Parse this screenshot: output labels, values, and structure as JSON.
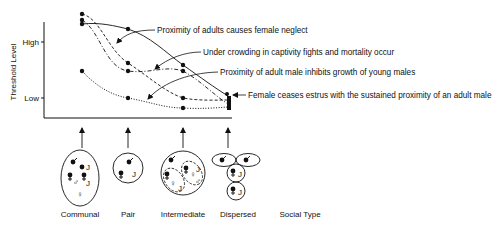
{
  "figure": {
    "y_axis": {
      "title": "Threshold Level",
      "ticks": [
        {
          "label": "High",
          "y": 42
        },
        {
          "label": "Low",
          "y": 98
        }
      ]
    },
    "x_axis": {
      "title": "Social Type",
      "categories": [
        "Communal",
        "Pair",
        "Intermediate",
        "Dispersed"
      ]
    },
    "curves": [
      {
        "name": "female-neglect",
        "label": "Proximity of adults causes female neglect",
        "style": "solid",
        "points": [
          [
            82,
            24
          ],
          [
            128,
            29
          ],
          [
            183,
            65
          ],
          [
            228,
            96
          ]
        ]
      },
      {
        "name": "crowding",
        "label": "Under crowding in captivity fights and mortality occur",
        "style": "dashed",
        "points": [
          [
            82,
            14
          ],
          [
            128,
            63
          ],
          [
            183,
            98
          ],
          [
            228,
            100
          ]
        ]
      },
      {
        "name": "young-males",
        "label": "Proximity of adult male inhibits growth of young males",
        "style": "dash-dot",
        "points": [
          [
            82,
            20
          ],
          [
            128,
            71
          ],
          [
            183,
            71
          ],
          [
            228,
            104
          ]
        ]
      },
      {
        "name": "estrus",
        "label": "Female ceases estrus with the sustained proximity of an adult male",
        "style": "dotted",
        "points": [
          [
            82,
            71
          ],
          [
            128,
            98
          ],
          [
            183,
            108
          ],
          [
            228,
            107
          ]
        ]
      }
    ],
    "symbols": {
      "male": "♂",
      "female": "♀",
      "juvenile": "J"
    }
  }
}
